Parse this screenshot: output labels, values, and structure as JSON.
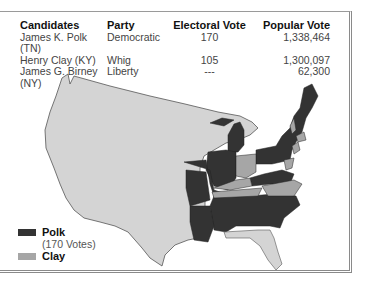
{
  "table": {
    "headers": [
      "Candidates",
      "Party",
      "Electoral Vote",
      "Popular Vote"
    ],
    "rows": [
      {
        "candidate": "James K. Polk (TN)",
        "party": "Democratic",
        "electoral": "170",
        "popular": "1,338,464"
      },
      {
        "candidate": "Henry Clay (KY)",
        "party": "Whig",
        "electoral": "105",
        "popular": "1,300,097"
      },
      {
        "candidate": "James G. Birney (NY)",
        "party": "Liberty",
        "electoral": "---",
        "popular": "62,300"
      }
    ]
  },
  "legend": {
    "items": [
      {
        "label": "Polk",
        "sublabel": "(170 Votes)",
        "color": "#333333"
      },
      {
        "label": "Clay",
        "color": "#a6a6a6"
      }
    ]
  },
  "map": {
    "territory_color": "#d4d4d4",
    "polk_color": "#333333",
    "clay_color": "#a6a6a6"
  }
}
